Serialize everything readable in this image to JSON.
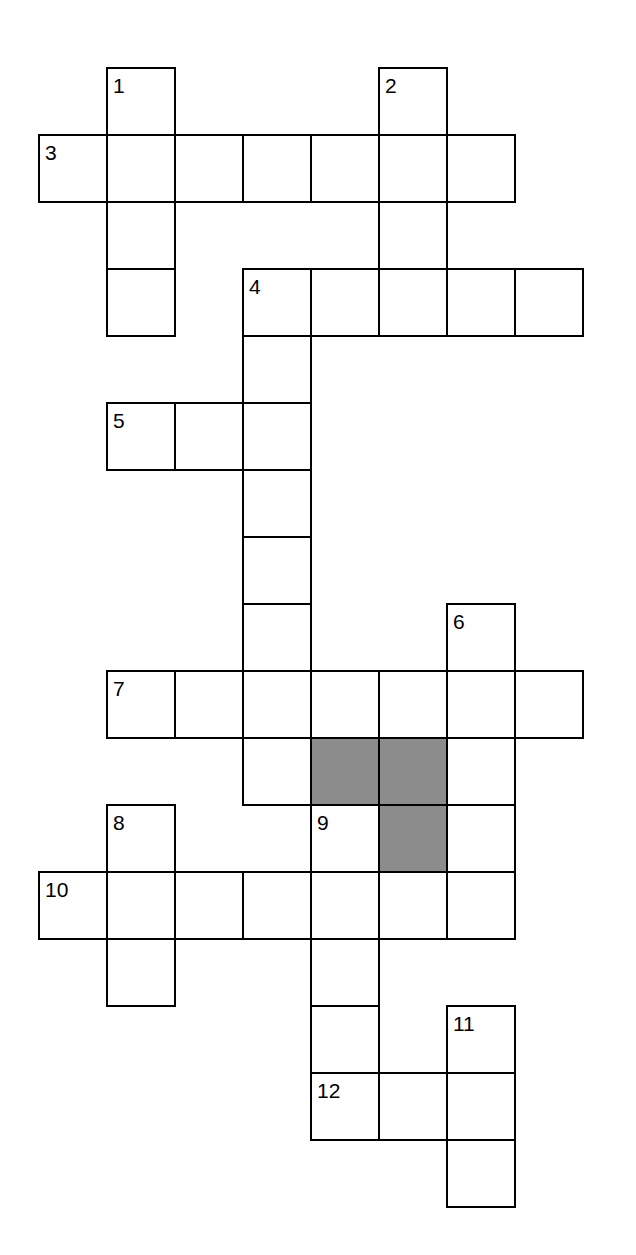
{
  "puzzle": {
    "title": "Crossword Puzzle Grid",
    "type": "crossword-grid",
    "background_color": "#ffffff",
    "cell_fill_color": "#ffffff",
    "shaded_fill_color": "#8c8c8c",
    "border_color": "#000000",
    "cell_width": 68,
    "cell_height": 67,
    "origin_x": 38,
    "origin_y": 67,
    "columns": 9,
    "rows": 18,
    "clue_numbers": [
      "1",
      "2",
      "3",
      "4",
      "5",
      "6",
      "7",
      "8",
      "9",
      "10",
      "11",
      "12"
    ],
    "entries": [
      {
        "number": "1",
        "direction": "down",
        "row": 0,
        "col": 1,
        "length": 4
      },
      {
        "number": "2",
        "direction": "down",
        "row": 0,
        "col": 5,
        "length": 4
      },
      {
        "number": "3",
        "direction": "across",
        "row": 1,
        "col": 0,
        "length": 7
      },
      {
        "number": "4",
        "direction": "across",
        "row": 3,
        "col": 3,
        "length": 5
      },
      {
        "number": "4",
        "direction": "down",
        "row": 3,
        "col": 3,
        "length": 5
      },
      {
        "number": "5",
        "direction": "across",
        "row": 5,
        "col": 1,
        "length": 3
      },
      {
        "number": "6",
        "direction": "down",
        "row": 8,
        "col": 6,
        "length": 4
      },
      {
        "number": "7",
        "direction": "across",
        "row": 9,
        "col": 1,
        "length": 7
      },
      {
        "number": "8",
        "direction": "down",
        "row": 11,
        "col": 1,
        "length": 4
      },
      {
        "number": "9",
        "direction": "down",
        "row": 11,
        "col": 4,
        "length": 5
      },
      {
        "number": "10",
        "direction": "across",
        "row": 12,
        "col": 0,
        "length": 7
      },
      {
        "number": "11",
        "direction": "down",
        "row": 14,
        "col": 6,
        "length": 4
      },
      {
        "number": "12",
        "direction": "across",
        "row": 15,
        "col": 4,
        "length": 3
      }
    ],
    "cells": [
      {
        "row": 0,
        "col": 1,
        "number": "1",
        "shaded": false
      },
      {
        "row": 0,
        "col": 5,
        "number": "2",
        "shaded": false
      },
      {
        "row": 1,
        "col": 0,
        "number": "3",
        "shaded": false
      },
      {
        "row": 1,
        "col": 1,
        "number": "",
        "shaded": false
      },
      {
        "row": 1,
        "col": 2,
        "number": "",
        "shaded": false
      },
      {
        "row": 1,
        "col": 3,
        "number": "",
        "shaded": false
      },
      {
        "row": 1,
        "col": 4,
        "number": "",
        "shaded": false
      },
      {
        "row": 1,
        "col": 5,
        "number": "",
        "shaded": false
      },
      {
        "row": 1,
        "col": 6,
        "number": "",
        "shaded": false
      },
      {
        "row": 2,
        "col": 1,
        "number": "",
        "shaded": false
      },
      {
        "row": 2,
        "col": 5,
        "number": "",
        "shaded": false
      },
      {
        "row": 3,
        "col": 1,
        "number": "",
        "shaded": false
      },
      {
        "row": 3,
        "col": 3,
        "number": "4",
        "shaded": false
      },
      {
        "row": 3,
        "col": 4,
        "number": "",
        "shaded": false
      },
      {
        "row": 3,
        "col": 5,
        "number": "",
        "shaded": false
      },
      {
        "row": 3,
        "col": 6,
        "number": "",
        "shaded": false
      },
      {
        "row": 3,
        "col": 7,
        "number": "",
        "shaded": false
      },
      {
        "row": 4,
        "col": 3,
        "number": "",
        "shaded": false
      },
      {
        "row": 5,
        "col": 1,
        "number": "5",
        "shaded": false
      },
      {
        "row": 5,
        "col": 2,
        "number": "",
        "shaded": false
      },
      {
        "row": 5,
        "col": 3,
        "number": "",
        "shaded": false
      },
      {
        "row": 6,
        "col": 3,
        "number": "",
        "shaded": false
      },
      {
        "row": 7,
        "col": 3,
        "number": "",
        "shaded": false
      },
      {
        "row": 8,
        "col": 3,
        "number": "",
        "shaded": false
      },
      {
        "row": 8,
        "col": 6,
        "number": "6",
        "shaded": false
      },
      {
        "row": 9,
        "col": 1,
        "number": "7",
        "shaded": false
      },
      {
        "row": 9,
        "col": 2,
        "number": "",
        "shaded": false
      },
      {
        "row": 9,
        "col": 3,
        "number": "",
        "shaded": false
      },
      {
        "row": 9,
        "col": 4,
        "number": "",
        "shaded": false
      },
      {
        "row": 9,
        "col": 5,
        "number": "",
        "shaded": false
      },
      {
        "row": 9,
        "col": 6,
        "number": "",
        "shaded": false
      },
      {
        "row": 9,
        "col": 7,
        "number": "",
        "shaded": false
      },
      {
        "row": 10,
        "col": 3,
        "number": "",
        "shaded": false
      },
      {
        "row": 10,
        "col": 4,
        "number": "",
        "shaded": true
      },
      {
        "row": 10,
        "col": 5,
        "number": "",
        "shaded": true
      },
      {
        "row": 10,
        "col": 6,
        "number": "",
        "shaded": false
      },
      {
        "row": 11,
        "col": 1,
        "number": "8",
        "shaded": false
      },
      {
        "row": 11,
        "col": 4,
        "number": "9",
        "shaded": false
      },
      {
        "row": 11,
        "col": 5,
        "number": "",
        "shaded": true
      },
      {
        "row": 11,
        "col": 6,
        "number": "",
        "shaded": false
      },
      {
        "row": 12,
        "col": 0,
        "number": "10",
        "shaded": false
      },
      {
        "row": 12,
        "col": 1,
        "number": "",
        "shaded": false
      },
      {
        "row": 12,
        "col": 2,
        "number": "",
        "shaded": false
      },
      {
        "row": 12,
        "col": 3,
        "number": "",
        "shaded": false
      },
      {
        "row": 12,
        "col": 4,
        "number": "",
        "shaded": false
      },
      {
        "row": 12,
        "col": 5,
        "number": "",
        "shaded": false
      },
      {
        "row": 12,
        "col": 6,
        "number": "",
        "shaded": false
      },
      {
        "row": 13,
        "col": 1,
        "number": "",
        "shaded": false
      },
      {
        "row": 13,
        "col": 4,
        "number": "",
        "shaded": false
      },
      {
        "row": 14,
        "col": 4,
        "number": "",
        "shaded": false
      },
      {
        "row": 14,
        "col": 6,
        "number": "11",
        "shaded": false
      },
      {
        "row": 15,
        "col": 4,
        "number": "12",
        "shaded": false
      },
      {
        "row": 15,
        "col": 5,
        "number": "",
        "shaded": false
      },
      {
        "row": 15,
        "col": 6,
        "number": "",
        "shaded": false
      },
      {
        "row": 16,
        "col": 6,
        "number": "",
        "shaded": false
      }
    ]
  }
}
